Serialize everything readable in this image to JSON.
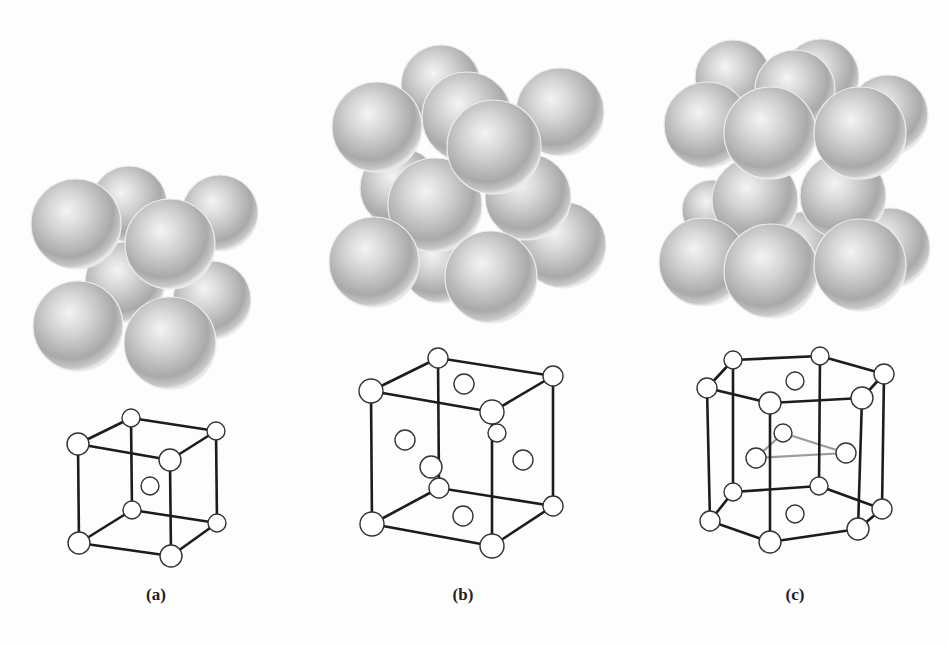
{
  "figure": {
    "panels": [
      {
        "id": "a",
        "label": "(a)",
        "label_pos": [
          156,
          585
        ],
        "structure": "body-centered cubic",
        "spheres": [
          {
            "c": [
              129,
              204
            ],
            "r": 38
          },
          {
            "c": [
              220,
              213
            ],
            "r": 38
          },
          {
            "c": [
              125,
              282
            ],
            "r": 40
          },
          {
            "c": [
              212,
              300
            ],
            "r": 39
          },
          {
            "c": [
              76,
              224
            ],
            "r": 45
          },
          {
            "c": [
              170,
              244
            ],
            "r": 45
          },
          {
            "c": [
              78,
              326
            ],
            "r": 45
          },
          {
            "c": [
              170,
              343
            ],
            "r": 46
          }
        ],
        "nodes": [
          {
            "c": [
              131,
              418
            ],
            "r": 9
          },
          {
            "c": [
              216,
              431
            ],
            "r": 9
          },
          {
            "c": [
              78,
              444
            ],
            "r": 11
          },
          {
            "c": [
              170,
              460
            ],
            "r": 11
          },
          {
            "c": [
              132,
              510
            ],
            "r": 9
          },
          {
            "c": [
              217,
              523
            ],
            "r": 9
          },
          {
            "c": [
              79,
              543
            ],
            "r": 11
          },
          {
            "c": [
              171,
              556
            ],
            "r": 11
          },
          {
            "c": [
              150,
              486
            ],
            "r": 9
          }
        ],
        "edges": [
          [
            0,
            1
          ],
          [
            0,
            2
          ],
          [
            1,
            3
          ],
          [
            2,
            3
          ],
          [
            4,
            5
          ],
          [
            4,
            6
          ],
          [
            5,
            7
          ],
          [
            6,
            7
          ],
          [
            0,
            4
          ],
          [
            1,
            5
          ],
          [
            2,
            6
          ],
          [
            3,
            7
          ]
        ],
        "gray_edges": []
      },
      {
        "id": "b",
        "label": "(b)",
        "label_pos": [
          463,
          585
        ],
        "structure": "face-centered cubic",
        "spheres": [
          {
            "c": [
              441,
              85
            ],
            "r": 40
          },
          {
            "c": [
              560,
              112
            ],
            "r": 44
          },
          {
            "c": [
              440,
              265
            ],
            "r": 38
          },
          {
            "c": [
              563,
              245
            ],
            "r": 43
          },
          {
            "c": [
              400,
              188
            ],
            "r": 40
          },
          {
            "c": [
              467,
              117
            ],
            "r": 45
          },
          {
            "c": [
              377,
              127
            ],
            "r": 45
          },
          {
            "c": [
              528,
              197
            ],
            "r": 43
          },
          {
            "c": [
              435,
              205
            ],
            "r": 47
          },
          {
            "c": [
              494,
              147
            ],
            "r": 47
          },
          {
            "c": [
              374,
              262
            ],
            "r": 45
          },
          {
            "c": [
              491,
              277
            ],
            "r": 46
          }
        ],
        "nodes": [
          {
            "c": [
              438,
              358
            ],
            "r": 10
          },
          {
            "c": [
              553,
              376
            ],
            "r": 10
          },
          {
            "c": [
              371,
              391
            ],
            "r": 12
          },
          {
            "c": [
              492,
              412
            ],
            "r": 12
          },
          {
            "c": [
              439,
              488
            ],
            "r": 10
          },
          {
            "c": [
              553,
              506
            ],
            "r": 10
          },
          {
            "c": [
              372,
              524
            ],
            "r": 12
          },
          {
            "c": [
              492,
              546
            ],
            "r": 12
          },
          {
            "c": [
              464,
              384
            ],
            "r": 10
          },
          {
            "c": [
              497,
              433
            ],
            "r": 9
          },
          {
            "c": [
              405,
              440
            ],
            "r": 10
          },
          {
            "c": [
              431,
              467
            ],
            "r": 11
          },
          {
            "c": [
              523,
              460
            ],
            "r": 10
          },
          {
            "c": [
              463,
              516
            ],
            "r": 10
          }
        ],
        "edges": [
          [
            0,
            1
          ],
          [
            0,
            2
          ],
          [
            1,
            3
          ],
          [
            2,
            3
          ],
          [
            4,
            5
          ],
          [
            4,
            6
          ],
          [
            5,
            7
          ],
          [
            6,
            7
          ],
          [
            0,
            4
          ],
          [
            1,
            5
          ],
          [
            2,
            6
          ],
          [
            3,
            7
          ]
        ],
        "gray_edges": []
      },
      {
        "id": "c",
        "label": "(c)",
        "label_pos": [
          795,
          585
        ],
        "structure": "hexagonal close-packed",
        "spheres": [
          {
            "c": [
              733,
              78
            ],
            "r": 38
          },
          {
            "c": [
              821,
              77
            ],
            "r": 38
          },
          {
            "c": [
              712,
              210
            ],
            "r": 30
          },
          {
            "c": [
              800,
              250
            ],
            "r": 38
          },
          {
            "c": [
              890,
              248
            ],
            "r": 40
          },
          {
            "c": [
              795,
              90
            ],
            "r": 40
          },
          {
            "c": [
              888,
              115
            ],
            "r": 40
          },
          {
            "c": [
              707,
              125
            ],
            "r": 43
          },
          {
            "c": [
              755,
              200
            ],
            "r": 43
          },
          {
            "c": [
              843,
              196
            ],
            "r": 43
          },
          {
            "c": [
              703,
              262
            ],
            "r": 44
          },
          {
            "c": [
              770,
              133
            ],
            "r": 46
          },
          {
            "c": [
              860,
              133
            ],
            "r": 46
          },
          {
            "c": [
              771,
              271
            ],
            "r": 47
          },
          {
            "c": [
              860,
              265
            ],
            "r": 46
          }
        ],
        "nodes": [
          {
            "c": [
              733,
              360
            ],
            "r": 9
          },
          {
            "c": [
              820,
              356
            ],
            "r": 9
          },
          {
            "c": [
              884,
              374
            ],
            "r": 10
          },
          {
            "c": [
              862,
              398
            ],
            "r": 11
          },
          {
            "c": [
              770,
              403
            ],
            "r": 11
          },
          {
            "c": [
              707,
              388
            ],
            "r": 10
          },
          {
            "c": [
              733,
              492
            ],
            "r": 9
          },
          {
            "c": [
              819,
              486
            ],
            "r": 9
          },
          {
            "c": [
              882,
              509
            ],
            "r": 10
          },
          {
            "c": [
              858,
              529
            ],
            "r": 11
          },
          {
            "c": [
              770,
              542
            ],
            "r": 11
          },
          {
            "c": [
              710,
              521
            ],
            "r": 10
          },
          {
            "c": [
              795,
              381
            ],
            "r": 9
          },
          {
            "c": [
              795,
              514
            ],
            "r": 9
          },
          {
            "c": [
              783,
              433
            ],
            "r": 9
          },
          {
            "c": [
              756,
              458
            ],
            "r": 10
          },
          {
            "c": [
              846,
              453
            ],
            "r": 10
          }
        ],
        "edges": [
          [
            0,
            1
          ],
          [
            1,
            2
          ],
          [
            2,
            3
          ],
          [
            3,
            4
          ],
          [
            4,
            5
          ],
          [
            5,
            0
          ],
          [
            6,
            7
          ],
          [
            7,
            8
          ],
          [
            8,
            9
          ],
          [
            9,
            10
          ],
          [
            10,
            11
          ],
          [
            11,
            6
          ],
          [
            0,
            6
          ],
          [
            1,
            7
          ],
          [
            2,
            8
          ],
          [
            3,
            9
          ],
          [
            4,
            10
          ],
          [
            5,
            11
          ]
        ],
        "gray_edges": [
          [
            14,
            15
          ],
          [
            15,
            16
          ],
          [
            16,
            14
          ]
        ]
      }
    ],
    "colors": {
      "background": "#fdfdfd",
      "line": "#1c1c1c",
      "gray_line": "#9a9a9a",
      "node_fill": "#ffffff",
      "sphere_highlight": "#f2f2f2",
      "sphere_mid": "#c4c4c4",
      "sphere_shadow": "#8f8f8f"
    }
  }
}
